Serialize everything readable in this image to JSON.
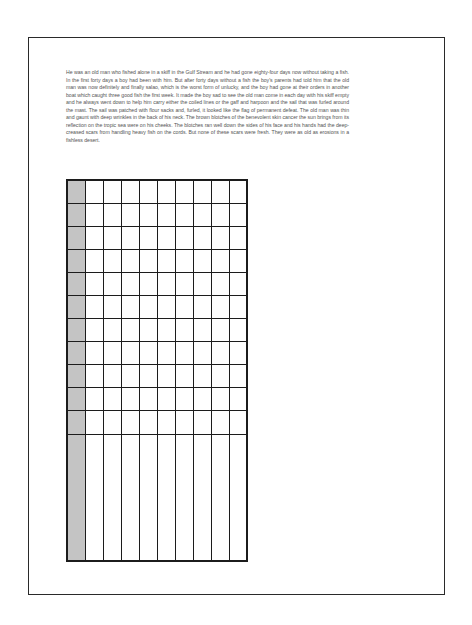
{
  "document": {
    "passage": "He was an old man who fished alone in a skiff in the Gulf Stream and he had gone eighty-four days now without taking a fish. In the first forty days a boy had been with him. But after forty days without a fish the boy's parents had told him that the old man was now definitely and finally salao, which is the worst form of unlucky, and the boy had gone at their orders in another boat which caught three good fish the first week. It made the boy sad to see the old man come in each day with his skiff empty and he always went down to help him carry either the coiled lines or the gaff and harpoon and the sail that was furled around the mast. The sail was patched with flour sacks and, furled, it looked like the flag of permanent defeat. The old man was thin and gaunt with deep wrinkles in the back of his neck. The brown blotches of the benevolent skin cancer the sun brings from its reflection on the tropic sea were on his cheeks. The blotches ran well down the sides of his face and his hands had the deep-creased scars from handling heavy fish on the cords. But none of these scars were fresh. They were as old as erosions in a fishless desert.",
    "grid": {
      "columns": 10,
      "standard_rows": 11,
      "tall_rows": 1,
      "shaded_column_index": 0,
      "shaded_color": "#c4c4c4",
      "line_color": "#1c1c1c",
      "cell_color": "#ffffff"
    }
  }
}
